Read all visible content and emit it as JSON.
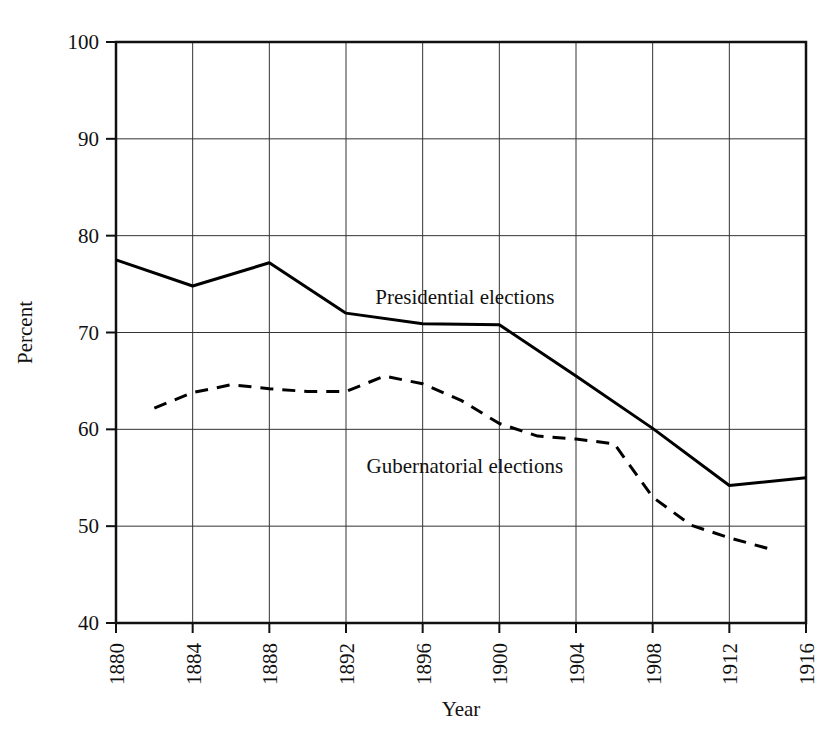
{
  "chart_data": {
    "type": "line",
    "title": "",
    "xlabel": "Year",
    "ylabel": "Percent",
    "xlim": [
      1880,
      1916
    ],
    "ylim": [
      40,
      100
    ],
    "grid": true,
    "legend_position": "inline-annotation",
    "x_ticks": [
      "1880",
      "1884",
      "1888",
      "1892",
      "1896",
      "1900",
      "1904",
      "1908",
      "1912",
      "1916"
    ],
    "y_ticks": [
      "40",
      "50",
      "60",
      "70",
      "80",
      "90",
      "100"
    ],
    "series": [
      {
        "name": "Presidential elections",
        "style": "solid",
        "color": "#000000",
        "points": [
          {
            "x": 1880,
            "y": 77.5
          },
          {
            "x": 1884,
            "y": 74.8
          },
          {
            "x": 1888,
            "y": 77.2
          },
          {
            "x": 1892,
            "y": 72.0
          },
          {
            "x": 1896,
            "y": 70.9
          },
          {
            "x": 1900,
            "y": 70.8
          },
          {
            "x": 1904,
            "y": 65.5
          },
          {
            "x": 1908,
            "y": 60.1
          },
          {
            "x": 1912,
            "y": 54.2
          },
          {
            "x": 1916,
            "y": 55.0
          }
        ]
      },
      {
        "name": "Gubernatorial elections",
        "style": "dashed",
        "color": "#000000",
        "points": [
          {
            "x": 1882,
            "y": 62.2
          },
          {
            "x": 1884,
            "y": 63.8
          },
          {
            "x": 1886,
            "y": 64.6
          },
          {
            "x": 1888,
            "y": 64.2
          },
          {
            "x": 1890,
            "y": 63.9
          },
          {
            "x": 1892,
            "y": 63.9
          },
          {
            "x": 1894,
            "y": 65.5
          },
          {
            "x": 1896,
            "y": 64.7
          },
          {
            "x": 1898,
            "y": 63.0
          },
          {
            "x": 1900,
            "y": 60.6
          },
          {
            "x": 1902,
            "y": 59.3
          },
          {
            "x": 1904,
            "y": 59.0
          },
          {
            "x": 1906,
            "y": 58.5
          },
          {
            "x": 1908,
            "y": 53.0
          },
          {
            "x": 1910,
            "y": 50.1
          },
          {
            "x": 1912,
            "y": 48.8
          },
          {
            "x": 1914,
            "y": 47.7
          }
        ]
      }
    ],
    "annotations": [
      {
        "text": "Presidential elections",
        "x": 1898.2,
        "y": 72.9
      },
      {
        "text": "Gubernatorial elections",
        "x": 1898.2,
        "y": 55.5
      }
    ]
  }
}
